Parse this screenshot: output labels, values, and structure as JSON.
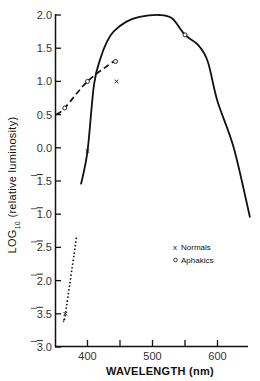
{
  "chart_data": {
    "type": "line",
    "title": "",
    "xlabel": "WAVELENGTH (nm)",
    "ylabel": "LOG10 (relative luminosity)",
    "ylabel_main": "LOG",
    "ylabel_sub": "10",
    "ylabel_rest": " (relative luminosity)",
    "xlim": [
      350,
      650
    ],
    "ylim": [
      -3.0,
      2.0
    ],
    "x_ticks": [
      {
        "value": 400,
        "label": "400"
      },
      {
        "value": 450,
        "label": ""
      },
      {
        "value": 500,
        "label": "500"
      },
      {
        "value": 550,
        "label": ""
      },
      {
        "value": 600,
        "label": "600"
      }
    ],
    "y_ticks": [
      {
        "value": 2.0,
        "label": "2.0",
        "bar": ""
      },
      {
        "value": 1.5,
        "label": "1.5",
        "bar": ""
      },
      {
        "value": 1.0,
        "label": "1.0",
        "bar": ""
      },
      {
        "value": 0.5,
        "label": "0.5",
        "bar": ""
      },
      {
        "value": 0.0,
        "label": "0.0",
        "bar": ""
      },
      {
        "value": -0.5,
        "label": ".5",
        "bar": "1"
      },
      {
        "value": -1.0,
        "label": ".0",
        "bar": "1"
      },
      {
        "value": -1.5,
        "label": ".5",
        "bar": "2"
      },
      {
        "value": -2.0,
        "label": ".0",
        "bar": "2"
      },
      {
        "value": -2.5,
        "label": ".5",
        "bar": "3"
      },
      {
        "value": -3.0,
        "label": ".0",
        "bar": "3"
      }
    ],
    "grid": false,
    "legend_position": "lower right",
    "series": [
      {
        "name": "Photopic luminosity curve",
        "style": "solid",
        "points": [
          [
            390,
            -0.55
          ],
          [
            400,
            -0.05
          ],
          [
            410,
            0.95
          ],
          [
            420,
            1.35
          ],
          [
            430,
            1.6
          ],
          [
            440,
            1.75
          ],
          [
            460,
            1.9
          ],
          [
            480,
            1.97
          ],
          [
            510,
            2.0
          ],
          [
            530,
            1.95
          ],
          [
            550,
            1.7
          ],
          [
            570,
            1.55
          ],
          [
            585,
            1.3
          ],
          [
            600,
            0.7
          ],
          [
            625,
            0.0
          ],
          [
            650,
            -1.05
          ]
        ]
      },
      {
        "name": "Extrapolation (dotted)",
        "style": "dotted",
        "points": [
          [
            363,
            -2.6
          ],
          [
            366,
            -2.5
          ],
          [
            383,
            -1.35
          ]
        ]
      },
      {
        "name": "Aphakics trend (dashed)",
        "style": "dashed",
        "points": [
          [
            352,
            0.5
          ],
          [
            365,
            0.6
          ],
          [
            400,
            1.0
          ],
          [
            440,
            1.3
          ]
        ]
      },
      {
        "name": "Normals",
        "marker": "x",
        "points": [
          [
            366,
            -2.5
          ],
          [
            400,
            -0.05
          ],
          [
            440,
            1.0
          ]
        ]
      },
      {
        "name": "Aphakics",
        "marker": "o",
        "points": [
          [
            365,
            0.6
          ],
          [
            400,
            1.0
          ],
          [
            440,
            1.3
          ],
          [
            550,
            1.7
          ]
        ]
      }
    ],
    "legend": [
      {
        "marker": "x",
        "label": "Normals"
      },
      {
        "marker": "o",
        "label": "Aphakics"
      }
    ]
  }
}
